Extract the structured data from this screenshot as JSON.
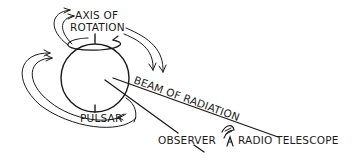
{
  "diagram": {
    "labels": {
      "axis_line1": "AXIS OF",
      "axis_line2": "ROTATION",
      "beam": "BEAM OF RADIATION",
      "pulsar": "PULSAR",
      "observer": "OBSERVER",
      "telescope": "RADIO TELESCOPE"
    },
    "icons": {
      "telescope": "radio-telescope-dish-icon"
    },
    "colors": {
      "ink": "#1a1a1a",
      "background": "#ffffff"
    }
  }
}
